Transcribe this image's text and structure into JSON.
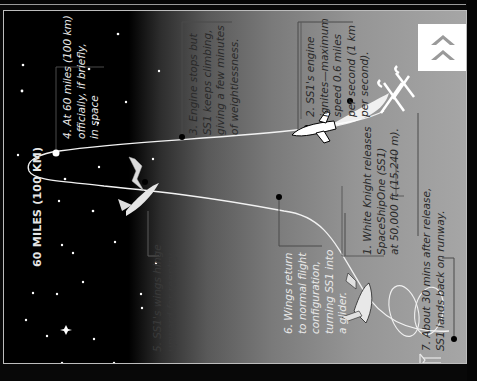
{
  "diagram": {
    "orientation": "rotated 90 degrees counter-clockwise",
    "altitude_label": "60 MILES (100 KM)",
    "nav_button": {
      "icon": "double-chevron-up-icon",
      "color": "#9a9a9a"
    },
    "colors": {
      "space": "#000000",
      "sky": "#a6a6a6",
      "trajectory": "#f2f2f2",
      "marker": "#000000",
      "callout_border": "#555555"
    },
    "steps": [
      {
        "number": "1",
        "lines": [
          "1. White Knight releases",
          "SpaceShipOne (SS1)",
          "at 50,000 ft (15,240 m)."
        ]
      },
      {
        "number": "2",
        "lines": [
          "2. SS1's engine",
          "ignites—maximum",
          "speed 0.6 miles",
          "per second (1 km",
          "per second)."
        ]
      },
      {
        "number": "3",
        "lines": [
          "3. Engine stops but",
          "SS1 keeps climbing,",
          "giving a few minutes",
          "of weightlessness."
        ]
      },
      {
        "number": "4",
        "lines": [
          "4. At 60 miles (100 km)",
          "officially, if briefly,",
          "in space"
        ]
      },
      {
        "number": "5",
        "lines": [
          "5. SS1's wings hinge",
          "upward for reentry."
        ]
      },
      {
        "number": "6",
        "lines": [
          "6. Wings return",
          "to normal flight",
          "configuration,",
          "turning SS1 into",
          "a glider."
        ]
      },
      {
        "number": "7",
        "lines": [
          "7. About 30 mins after release,",
          "SS1 lands back on runway."
        ]
      }
    ]
  }
}
